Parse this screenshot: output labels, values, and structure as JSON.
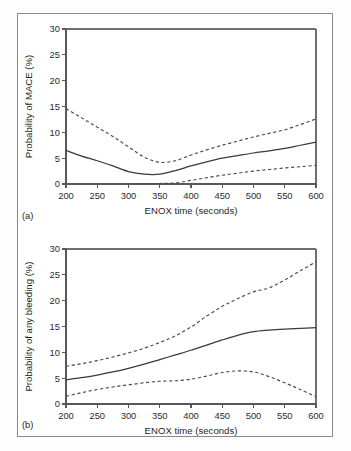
{
  "figure": {
    "panel_a_tag": "(a)",
    "panel_b_tag": "(b)",
    "border_color": "#8a8a8e",
    "background_color": "#ffffff",
    "curve_color": "#3a3a3e"
  },
  "chart_data": [
    {
      "type": "line",
      "panel": "(a)",
      "title": "",
      "xlabel": "ENOX time (seconds)",
      "ylabel": "Probability of MACE (%)",
      "xlim": [
        200,
        600
      ],
      "ylim": [
        0,
        30
      ],
      "xticks": [
        200,
        250,
        300,
        350,
        400,
        450,
        500,
        550,
        600
      ],
      "yticks": [
        0,
        5,
        10,
        15,
        20,
        25,
        30
      ],
      "xtick_labels": [
        "200",
        "250",
        "300",
        "350",
        "400",
        "450",
        "500",
        "550",
        "600"
      ],
      "ytick_labels": [
        "0",
        "5",
        "10",
        "15",
        "20",
        "25",
        "30"
      ],
      "grid": false,
      "legend": "none",
      "x": [
        200,
        225,
        250,
        275,
        300,
        325,
        350,
        375,
        400,
        425,
        450,
        475,
        500,
        525,
        550,
        575,
        600
      ],
      "series": [
        {
          "name": "Predicted probability",
          "style": "solid",
          "values": [
            6.5,
            5.4,
            4.5,
            3.5,
            2.4,
            1.9,
            1.9,
            2.6,
            3.5,
            4.3,
            5.0,
            5.5,
            6.0,
            6.4,
            6.9,
            7.5,
            8.1
          ]
        },
        {
          "name": "Upper 95% confidence limit",
          "style": "dashed",
          "values": [
            14.6,
            12.8,
            11.0,
            9.2,
            7.2,
            5.2,
            4.2,
            4.5,
            5.6,
            6.6,
            7.5,
            8.3,
            9.1,
            9.8,
            10.5,
            11.5,
            12.6
          ]
        },
        {
          "name": "Lower 95% confidence limit",
          "style": "dashed",
          "values": [
            -0.2,
            -0.2,
            -0.2,
            -0.15,
            -0.1,
            0.0,
            0.1,
            0.2,
            0.7,
            1.2,
            1.7,
            2.1,
            2.5,
            2.8,
            3.1,
            3.35,
            3.6
          ]
        }
      ]
    },
    {
      "type": "line",
      "panel": "(b)",
      "title": "",
      "xlabel": "ENOX time (seconds)",
      "ylabel": "Probability of any bleeding (%)",
      "xlim": [
        200,
        600
      ],
      "ylim": [
        0,
        30
      ],
      "xticks": [
        200,
        250,
        300,
        350,
        400,
        450,
        500,
        550,
        600
      ],
      "yticks": [
        0,
        5,
        10,
        15,
        20,
        25,
        30
      ],
      "xtick_labels": [
        "200",
        "250",
        "300",
        "350",
        "400",
        "450",
        "500",
        "550",
        "600"
      ],
      "ytick_labels": [
        "0",
        "5",
        "10",
        "15",
        "20",
        "25",
        "30"
      ],
      "grid": false,
      "legend": "none",
      "x": [
        200,
        225,
        250,
        275,
        300,
        325,
        350,
        375,
        400,
        425,
        450,
        475,
        500,
        525,
        550,
        575,
        600
      ],
      "series": [
        {
          "name": "Predicted probability",
          "style": "solid",
          "values": [
            4.7,
            5.1,
            5.6,
            6.2,
            6.9,
            7.7,
            8.6,
            9.5,
            10.4,
            11.4,
            12.4,
            13.3,
            14.0,
            14.3,
            14.5,
            14.65,
            14.8
          ]
        },
        {
          "name": "Upper 95% confidence limit",
          "style": "dashed",
          "values": [
            7.3,
            7.8,
            8.4,
            9.1,
            9.9,
            10.8,
            11.9,
            13.2,
            14.9,
            17.0,
            18.9,
            20.4,
            21.7,
            22.5,
            24.0,
            25.8,
            27.5
          ]
        },
        {
          "name": "Lower 95% confidence limit",
          "style": "dashed",
          "values": [
            1.5,
            2.2,
            2.8,
            3.3,
            3.7,
            4.1,
            4.4,
            4.5,
            4.8,
            5.4,
            6.1,
            6.4,
            6.2,
            5.3,
            4.1,
            2.8,
            1.4
          ]
        }
      ]
    }
  ]
}
